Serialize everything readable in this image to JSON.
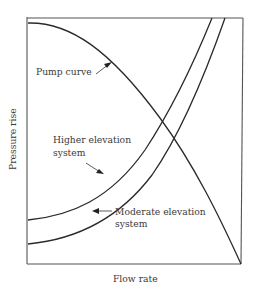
{
  "diagram": {
    "type": "pump-system-curve",
    "axes": {
      "xlabel": "Flow rate",
      "ylabel": "Pressure rise"
    },
    "curves": [
      {
        "id": "pump",
        "label": "Pump curve",
        "shape": "decreasing concave-down"
      },
      {
        "id": "higher",
        "label_line1": "Higher elevation",
        "label_line2": "system",
        "shape": "increasing concave-up"
      },
      {
        "id": "moderate",
        "label_line1": "Moderate elevation",
        "label_line2": "system",
        "shape": "increasing concave-up"
      }
    ],
    "labels": {
      "pump": "Pump curve",
      "higher_line1": "Higher elevation",
      "higher_line2": "system",
      "moderate_line1": "Moderate elevation",
      "moderate_line2": "system"
    },
    "colors": {
      "curve": "#2a2a2a",
      "axis": "#555555",
      "text": "#3a3a3a",
      "background": "#ffffff"
    }
  }
}
